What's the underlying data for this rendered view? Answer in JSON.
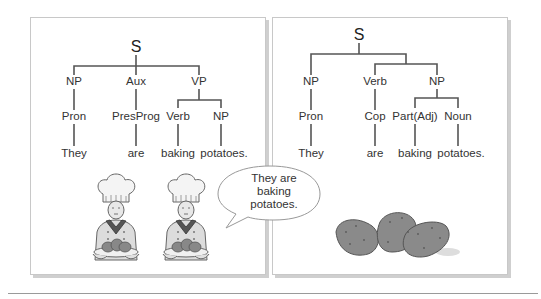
{
  "left_panel": {
    "tree": {
      "root": "S",
      "level1": [
        "NP",
        "Aux",
        "VP"
      ],
      "level2": [
        "Pron",
        "PresProg",
        "Verb",
        "NP"
      ],
      "leaves": [
        "They",
        "are",
        "baking",
        "potatoes."
      ]
    },
    "illustration": "two-chefs-holding-potatoes"
  },
  "speech_bubble": {
    "lines": [
      "They are",
      "baking",
      "potatoes."
    ]
  },
  "right_panel": {
    "tree": {
      "root": "S",
      "level1": [
        "NP",
        "Verb",
        "NP"
      ],
      "level2": [
        "Pron",
        "Cop",
        "Part(Adj)",
        "Noun"
      ],
      "leaves": [
        "They",
        "are",
        "baking",
        "potatoes."
      ]
    },
    "illustration": "three-potatoes"
  },
  "colors": {
    "tree_line": "#555555",
    "panel_border": "#c8c8c8",
    "potato": "#8a8a8a"
  }
}
